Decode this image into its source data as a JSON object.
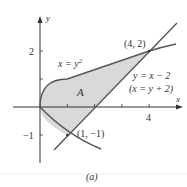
{
  "figure": {
    "caption": "(a)",
    "region_label": "A",
    "axes": {
      "x_label": "x",
      "y_label": "y",
      "x_ticks": [
        1,
        2,
        3,
        4
      ],
      "x_tick_label": "4",
      "y_ticks": [
        -1,
        1,
        2
      ],
      "y_tick_labels": [
        "2",
        "−1"
      ]
    },
    "curves": [
      {
        "name": "parabola",
        "equation": "x = y²",
        "label_main": "x = y",
        "label_sup": "2"
      },
      {
        "name": "line",
        "equation": "y = x − 2",
        "label_main": "y = x − 2",
        "label_alt": "(x = y + 2)"
      }
    ],
    "points": [
      {
        "label": "(4, 2)",
        "x": 4,
        "y": 2
      },
      {
        "label": "(1, −1)",
        "x": 1,
        "y": -1
      }
    ],
    "colors": {
      "curve": "#555555",
      "fill": "#d9d9d9",
      "axis": "#333333"
    }
  }
}
